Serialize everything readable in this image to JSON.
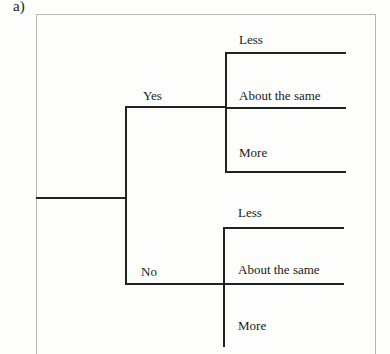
{
  "panel_label": "a)",
  "tree": {
    "branches": [
      {
        "label": "Yes",
        "leaves": [
          "Less",
          "About the same",
          "More"
        ]
      },
      {
        "label": "No",
        "leaves": [
          "Less",
          "About the same",
          "More"
        ]
      }
    ]
  },
  "colors": {
    "line": "#222222",
    "frame": "#b5b5b5",
    "background": "#fdfdfc"
  }
}
